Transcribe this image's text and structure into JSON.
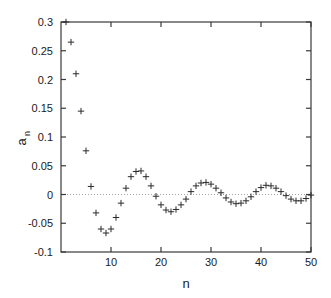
{
  "chart_data": {
    "type": "scatter",
    "title": "",
    "xlabel": "n",
    "ylabel": "a_n",
    "ylabel_base": "a",
    "ylabel_sub": "n",
    "marker": "plus",
    "marker_color": "#2b2b2b",
    "grid": false,
    "zero_line": true,
    "zero_line_style": "dotted",
    "legend": "none",
    "xlim": [
      0,
      50
    ],
    "ylim": [
      -0.1,
      0.3
    ],
    "xticks": [
      10,
      20,
      30,
      40,
      50
    ],
    "xticklabels": [
      "10",
      "20",
      "30",
      "40",
      "50"
    ],
    "yticks": [
      -0.1,
      -0.05,
      0,
      0.05,
      0.1,
      0.15,
      0.2,
      0.25,
      0.3
    ],
    "yticklabels": [
      "-0.1",
      "-0.05",
      "0",
      "0.05",
      "0.1",
      "0.15",
      "0.2",
      "0.25",
      "0.3"
    ],
    "x": [
      1,
      2,
      3,
      4,
      5,
      6,
      7,
      8,
      9,
      10,
      11,
      12,
      13,
      14,
      15,
      16,
      17,
      18,
      19,
      20,
      21,
      22,
      23,
      24,
      25,
      26,
      27,
      28,
      29,
      30,
      31,
      32,
      33,
      34,
      35,
      36,
      37,
      38,
      39,
      40,
      41,
      42,
      43,
      44,
      45,
      46,
      47,
      48,
      49,
      50
    ],
    "values": [
      0.3,
      0.265,
      0.21,
      0.145,
      0.076,
      0.014,
      -0.032,
      -0.06,
      -0.067,
      -0.06,
      -0.04,
      -0.015,
      0.011,
      0.031,
      0.04,
      0.041,
      0.031,
      0.015,
      -0.003,
      -0.018,
      -0.027,
      -0.03,
      -0.026,
      -0.018,
      -0.008,
      0.005,
      0.015,
      0.02,
      0.021,
      0.018,
      0.011,
      0.003,
      -0.006,
      -0.013,
      -0.016,
      -0.015,
      -0.011,
      -0.004,
      0.005,
      0.012,
      0.016,
      0.015,
      0.011,
      0.005,
      -0.002,
      -0.008,
      -0.011,
      -0.011,
      -0.007,
      -0.001
    ],
    "series_name": "a_n"
  },
  "axes": {
    "x_axis_name": "n",
    "y_axis_name": "a_n"
  }
}
